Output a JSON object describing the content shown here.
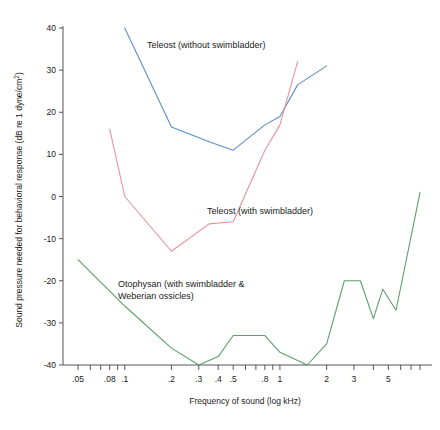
{
  "chart_data": {
    "type": "line",
    "title": "",
    "xlabel": "Frequency of sound (log kHz)",
    "ylabel": "Sound pressure needed for behavioral response (dB re 1 dyne/cm2)",
    "ylabel_display": "Sound pressure needed for behavioral response (dB re 1 dyne/cm",
    "ylabel_superscript": "2",
    "ylabel_suffix": ")",
    "x_scale": "log",
    "xlim": [
      0.04,
      9.0
    ],
    "ylim": [
      -44,
      44
    ],
    "grid": false,
    "legend_position": "inline-annotations",
    "x_tick_labels": [
      ".05",
      ".08",
      ".1",
      ".2",
      ".3",
      ".4",
      ".5",
      ".8",
      "1",
      "2",
      "3",
      "5"
    ],
    "x_tick_values": [
      0.05,
      0.08,
      0.1,
      0.2,
      0.3,
      0.4,
      0.5,
      0.8,
      1,
      2,
      3,
      5
    ],
    "x_minor_ticks": [
      0.05,
      0.06,
      0.07,
      0.08,
      0.09,
      0.1,
      0.2,
      0.3,
      0.4,
      0.5,
      0.6,
      0.7,
      0.8,
      0.9,
      1,
      2,
      3,
      4,
      5,
      6,
      7,
      8
    ],
    "y_tick_labels": [
      "-40",
      "-30",
      "-20",
      "-10",
      "0",
      "10",
      "20",
      "30",
      "40"
    ],
    "y_tick_values": [
      -40,
      -30,
      -20,
      -10,
      0,
      10,
      20,
      30,
      40
    ],
    "series": [
      {
        "name": "Teleost (without swimbladder)",
        "color": "#5b8fc9",
        "label_text": "Teleost (without swimbladder)",
        "x": [
          0.1,
          0.2,
          0.35,
          0.5,
          0.8,
          1.0,
          1.3,
          2.0
        ],
        "y": [
          40,
          16.5,
          13,
          11,
          17,
          19,
          26.5,
          31
        ]
      },
      {
        "name": "Teleost (with swimbladder)",
        "color": "#e8929a",
        "label_text": "Teleost (with swimbladder)",
        "x": [
          0.08,
          0.1,
          0.2,
          0.35,
          0.5,
          0.8,
          1.0,
          1.3
        ],
        "y": [
          16,
          0,
          -13,
          -6.5,
          -6,
          11,
          17,
          32
        ]
      },
      {
        "name": "Otophysan (with swimbladder & Weberian ossicles)",
        "color": "#5aa06a",
        "label_text_line1": "Otophysan (with swimbladder &",
        "label_text_line2": "Weberian ossicles)",
        "x": [
          0.05,
          0.1,
          0.2,
          0.3,
          0.4,
          0.5,
          0.8,
          1.0,
          1.5,
          2.0,
          2.6,
          3.3,
          4.0,
          4.6,
          5.6,
          8.0
        ],
        "y": [
          -15,
          -26,
          -36,
          -40,
          -38,
          -33,
          -33,
          -37,
          -40,
          -35,
          -20,
          -20,
          -29,
          -22,
          -27,
          1
        ]
      }
    ],
    "annotations": [
      {
        "text": "Teleost (without swimbladder)",
        "x_px": 147,
        "y_px": 48
      },
      {
        "text": "Teleost (with swimbladder)",
        "x_px": 207,
        "y_px": 214
      },
      {
        "text": "Otophysan (with swimbladder &",
        "x_px": 118,
        "y_px": 287
      },
      {
        "text": "Weberian ossicles)",
        "x_px": 118,
        "y_px": 299
      }
    ]
  }
}
